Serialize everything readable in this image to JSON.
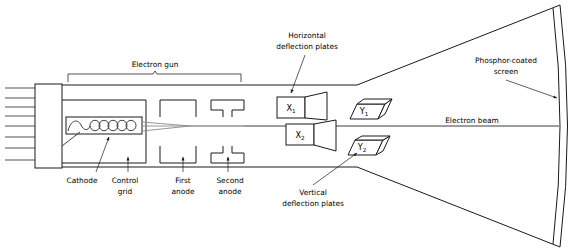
{
  "figure": {
    "type": "technical-diagram",
    "width": 575,
    "height": 252,
    "background_color": "#ffffff",
    "line_color": "#1a1a1a",
    "beam_color": "#8a8a8a"
  },
  "labels": {
    "electron_gun": "Electron gun",
    "horizontal_deflection_plates_line1": "Horizontal",
    "horizontal_deflection_plates_line2": "deflection plates",
    "phosphor_screen_line1": "Phosphor-coated",
    "phosphor_screen_line2": "screen",
    "electron_beam": "Electron beam",
    "vertical_deflection_plates_line1": "Vertical",
    "vertical_deflection_plates_line2": "deflection plates",
    "cathode": "Cathode",
    "control_grid_line1": "Control",
    "control_grid_line2": "grid",
    "first_anode_line1": "First",
    "first_anode_line2": "anode",
    "second_anode_line1": "Second",
    "second_anode_line2": "anode"
  },
  "plates": {
    "x1": {
      "base": "X",
      "sub": "1"
    },
    "x2": {
      "base": "X",
      "sub": "2"
    },
    "y1": {
      "base": "Y",
      "sub": "1"
    },
    "y2": {
      "base": "Y",
      "sub": "2"
    }
  },
  "components": {
    "base_pins_count": 8,
    "heater_coil_loops": 5,
    "anodes": [
      "first-anode",
      "second-anode"
    ],
    "screen_shape": "curved-phosphor-screen"
  }
}
